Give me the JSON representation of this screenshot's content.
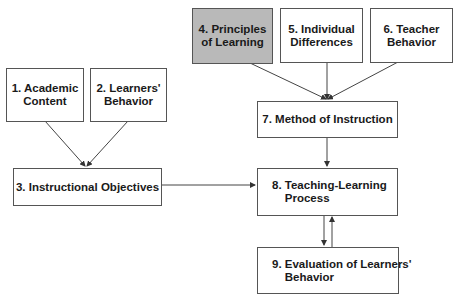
{
  "diagram": {
    "nodes": [
      {
        "id": "1",
        "label": "1. Academic\nContent"
      },
      {
        "id": "2",
        "label": "2. Learners'\nBehavior"
      },
      {
        "id": "3",
        "label": "3. Instructional Objectives"
      },
      {
        "id": "4",
        "label": "4. Principles\nof Learning",
        "highlighted": true
      },
      {
        "id": "5",
        "label": "5. Individual\nDifferences"
      },
      {
        "id": "6",
        "label": "6. Teacher\nBehavior"
      },
      {
        "id": "7",
        "label": "7. Method of Instruction"
      },
      {
        "id": "8",
        "label": "8. Teaching-Learning\n    Process"
      },
      {
        "id": "9",
        "label": "9. Evaluation of Learners'\n    Behavior"
      }
    ],
    "edges": [
      {
        "from": "1",
        "to": "3"
      },
      {
        "from": "2",
        "to": "3"
      },
      {
        "from": "4",
        "to": "7"
      },
      {
        "from": "5",
        "to": "7"
      },
      {
        "from": "6",
        "to": "7"
      },
      {
        "from": "3",
        "to": "8"
      },
      {
        "from": "7",
        "to": "8"
      },
      {
        "from": "8",
        "to": "9"
      },
      {
        "from": "9",
        "to": "8"
      }
    ],
    "colors": {
      "highlight": "#b9b9b9",
      "line": "#444444",
      "border": "#555555"
    }
  }
}
